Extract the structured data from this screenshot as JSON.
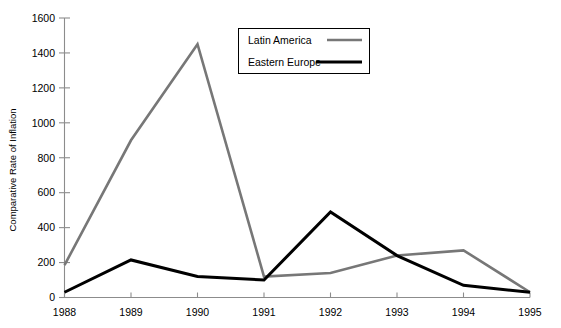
{
  "chart_data": {
    "type": "line",
    "title": "",
    "xlabel": "",
    "ylabel": "Comparative Rate of Inflation",
    "x": [
      1988,
      1989,
      1990,
      1991,
      1992,
      1993,
      1994,
      1995
    ],
    "xtick_labels": [
      "1988",
      "1989",
      "1990",
      "1991",
      "1992",
      "1993",
      "1994",
      "1995"
    ],
    "ytick_labels": [
      "0",
      "200",
      "400",
      "600",
      "800",
      "1000",
      "1200",
      "1400",
      "1600"
    ],
    "yticks": [
      0,
      200,
      400,
      600,
      800,
      1000,
      1200,
      1400,
      1600
    ],
    "ylim": [
      0,
      1600
    ],
    "xlim": [
      1988,
      1995
    ],
    "grid": false,
    "legend_position": "top-center-right",
    "series": [
      {
        "name": "Latin America",
        "color": "#777777",
        "width": 2.6,
        "values": [
          185,
          900,
          1450,
          120,
          140,
          240,
          270,
          30
        ]
      },
      {
        "name": "Eastern Europe",
        "color": "#000000",
        "width": 3.0,
        "values": [
          30,
          215,
          120,
          100,
          490,
          240,
          70,
          30
        ]
      }
    ]
  },
  "legend": {
    "entries": [
      {
        "label": "Latin America"
      },
      {
        "label": "Eastern Europe"
      }
    ]
  }
}
